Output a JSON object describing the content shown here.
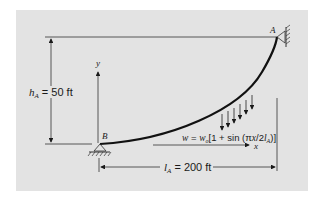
{
  "diagram": {
    "type": "cable-with-distributed-load",
    "points": {
      "A": "A",
      "B": "B"
    },
    "axes": {
      "x_label": "x",
      "y_label": "y"
    },
    "height_dimension": {
      "symbol": "h",
      "subscript": "A",
      "equals": " = 50 ft"
    },
    "length_dimension": {
      "symbol": "l",
      "subscript": "A",
      "equals": " = 200 ft"
    },
    "load_equation": {
      "w": "w",
      "eq": " = ",
      "w0": "w",
      "w0_sub": "o",
      "body": "[1 + sin (π",
      "x": "x",
      "mid": "/2",
      "l": "l",
      "l_sub": "A",
      "close": ")]"
    },
    "colors": {
      "background_panel": "#e3e3e3",
      "lines": "#1a1a1a"
    }
  }
}
